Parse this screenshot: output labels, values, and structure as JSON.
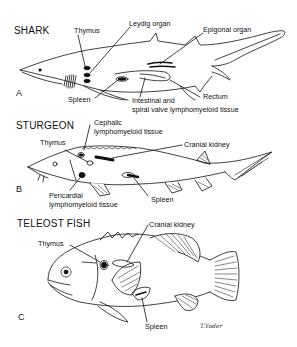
{
  "panels": [
    {
      "letter": "A",
      "title": "SHARK",
      "labels": {
        "thymus": "Thymus",
        "leydig": "Leydig organ",
        "epigonal": "Epigonal organ",
        "spleen": "Spleen",
        "intestinal_1": "Intestinal and",
        "intestinal_2": "spiral valve lymphomyeloid tissue",
        "rectum": "Rectum"
      }
    },
    {
      "letter": "B",
      "title": "STURGEON",
      "labels": {
        "cephalic_1": "Cephalic",
        "cephalic_2": "lymphomyeloid tissue",
        "thymus": "Thymus",
        "cranial_kidney": "Cranial kidney",
        "pericardial_1": "Pericardial",
        "pericardial_2": "lymphomyeloid tissue",
        "spleen": "Spleen"
      }
    },
    {
      "letter": "C",
      "title": "TELEOST FISH",
      "labels": {
        "thymus": "Thymus",
        "cranial_kidney": "Cranial kidney",
        "spleen": "Spleen"
      }
    }
  ],
  "signature": "T.Yoder",
  "colors": {
    "ink": "#111111",
    "background": "#ffffff"
  }
}
